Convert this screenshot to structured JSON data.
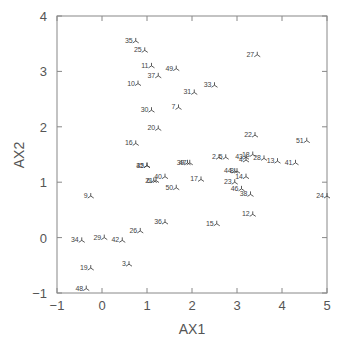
{
  "chart_data": {
    "type": "scatter",
    "title": "",
    "xlabel": "AX1",
    "ylabel": "AX2",
    "xlim": [
      -1,
      5
    ],
    "ylim": [
      -1,
      4
    ],
    "xticks": [
      -1,
      0,
      1,
      2,
      3,
      4,
      5
    ],
    "yticks": [
      -1,
      0,
      1,
      2,
      3,
      4
    ],
    "grid": false,
    "legend": null,
    "marker": "tri-down (⅄)",
    "points": [
      {
        "label": "35",
        "x": 0.75,
        "y": 3.55
      },
      {
        "label": "25",
        "x": 0.95,
        "y": 3.38
      },
      {
        "label": "11",
        "x": 1.1,
        "y": 3.1
      },
      {
        "label": "49",
        "x": 1.65,
        "y": 3.05
      },
      {
        "label": "37",
        "x": 1.25,
        "y": 2.92
      },
      {
        "label": "10",
        "x": 0.8,
        "y": 2.78
      },
      {
        "label": "27",
        "x": 3.45,
        "y": 3.3
      },
      {
        "label": "33",
        "x": 2.5,
        "y": 2.75
      },
      {
        "label": "31",
        "x": 2.05,
        "y": 2.62
      },
      {
        "label": "7",
        "x": 1.7,
        "y": 2.35
      },
      {
        "label": "30",
        "x": 1.1,
        "y": 2.3
      },
      {
        "label": "20",
        "x": 1.25,
        "y": 1.97
      },
      {
        "label": "22",
        "x": 3.4,
        "y": 1.85
      },
      {
        "label": "51",
        "x": 4.55,
        "y": 1.75
      },
      {
        "label": "16",
        "x": 0.75,
        "y": 1.7
      },
      {
        "label": "2",
        "x": 2.6,
        "y": 1.45
      },
      {
        "label": "5",
        "x": 2.75,
        "y": 1.45
      },
      {
        "label": "43",
        "x": 3.2,
        "y": 1.45
      },
      {
        "label": "18",
        "x": 3.35,
        "y": 1.5
      },
      {
        "label": "4",
        "x": 3.2,
        "y": 1.4
      },
      {
        "label": "28",
        "x": 3.6,
        "y": 1.43
      },
      {
        "label": "13",
        "x": 3.9,
        "y": 1.38
      },
      {
        "label": "41",
        "x": 4.3,
        "y": 1.35
      },
      {
        "label": "32",
        "x": 1.0,
        "y": 1.3
      },
      {
        "label": "45",
        "x": 1.0,
        "y": 1.3
      },
      {
        "label": "39",
        "x": 1.9,
        "y": 1.35
      },
      {
        "label": "47",
        "x": 1.95,
        "y": 1.35
      },
      {
        "label": "44",
        "x": 2.95,
        "y": 1.2
      },
      {
        "label": "8",
        "x": 3.0,
        "y": 1.2
      },
      {
        "label": "40",
        "x": 1.4,
        "y": 1.1
      },
      {
        "label": "14",
        "x": 3.2,
        "y": 1.1
      },
      {
        "label": "17",
        "x": 2.2,
        "y": 1.05
      },
      {
        "label": "6",
        "x": 1.15,
        "y": 1.03
      },
      {
        "label": "21",
        "x": 1.2,
        "y": 1.03
      },
      {
        "label": "23",
        "x": 2.95,
        "y": 1.0
      },
      {
        "label": "50",
        "x": 1.65,
        "y": 0.9
      },
      {
        "label": "46",
        "x": 3.1,
        "y": 0.88
      },
      {
        "label": "38",
        "x": 3.3,
        "y": 0.78
      },
      {
        "label": "9",
        "x": -0.25,
        "y": 0.75
      },
      {
        "label": "24",
        "x": 5.0,
        "y": 0.75
      },
      {
        "label": "12",
        "x": 3.35,
        "y": 0.42
      },
      {
        "label": "36",
        "x": 1.4,
        "y": 0.28
      },
      {
        "label": "15",
        "x": 2.55,
        "y": 0.25
      },
      {
        "label": "26",
        "x": 0.85,
        "y": 0.12
      },
      {
        "label": "29",
        "x": 0.05,
        "y": 0.0
      },
      {
        "label": "42",
        "x": 0.45,
        "y": -0.05
      },
      {
        "label": "34",
        "x": -0.45,
        "y": -0.05
      },
      {
        "label": "3",
        "x": 0.6,
        "y": -0.48
      },
      {
        "label": "19",
        "x": -0.25,
        "y": -0.55
      },
      {
        "label": "48",
        "x": -0.35,
        "y": -0.92
      }
    ]
  }
}
